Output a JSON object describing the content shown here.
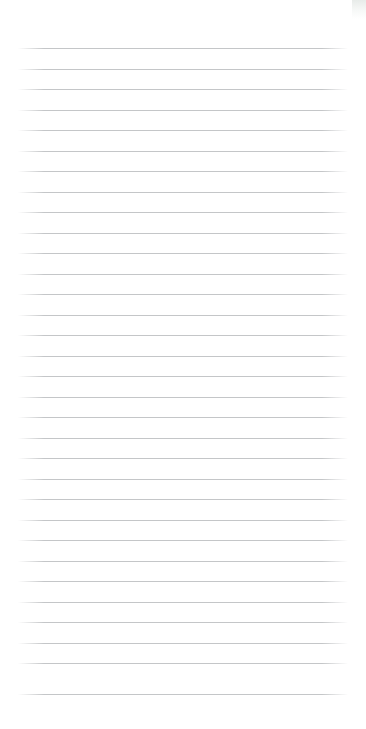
{
  "page": {
    "kind": "ruled-notepaper",
    "title": "",
    "width": 366,
    "height": 729,
    "background_color": "#ffffff",
    "text_content": "",
    "is_blank": true
  },
  "ruling": {
    "line_color": "#c0c2c4",
    "line_thickness_px": 1,
    "line_spacing_px": 20.4,
    "first_line_y_px": 48,
    "line_left_x_px": 18,
    "line_right_x_px": 348,
    "line_count": 32,
    "margin_top_px": 48,
    "margin_bottom_px": 34,
    "margin_left_px": 18,
    "margin_right_px": 18,
    "has_vertical_margin_rule": false,
    "lines": [
      {
        "index": 1,
        "y": 48,
        "written_text": ""
      },
      {
        "index": 2,
        "y": 69,
        "written_text": ""
      },
      {
        "index": 3,
        "y": 89,
        "written_text": ""
      },
      {
        "index": 4,
        "y": 110,
        "written_text": ""
      },
      {
        "index": 5,
        "y": 130,
        "written_text": ""
      },
      {
        "index": 6,
        "y": 151,
        "written_text": ""
      },
      {
        "index": 7,
        "y": 171,
        "written_text": ""
      },
      {
        "index": 8,
        "y": 192,
        "written_text": ""
      },
      {
        "index": 9,
        "y": 212,
        "written_text": ""
      },
      {
        "index": 10,
        "y": 233,
        "written_text": ""
      },
      {
        "index": 11,
        "y": 253,
        "written_text": ""
      },
      {
        "index": 12,
        "y": 274,
        "written_text": ""
      },
      {
        "index": 13,
        "y": 294,
        "written_text": ""
      },
      {
        "index": 14,
        "y": 315,
        "written_text": ""
      },
      {
        "index": 15,
        "y": 335,
        "written_text": ""
      },
      {
        "index": 16,
        "y": 356,
        "written_text": ""
      },
      {
        "index": 17,
        "y": 376,
        "written_text": ""
      },
      {
        "index": 18,
        "y": 397,
        "written_text": ""
      },
      {
        "index": 19,
        "y": 417,
        "written_text": ""
      },
      {
        "index": 20,
        "y": 438,
        "written_text": ""
      },
      {
        "index": 21,
        "y": 458,
        "written_text": ""
      },
      {
        "index": 22,
        "y": 479,
        "written_text": ""
      },
      {
        "index": 23,
        "y": 499,
        "written_text": ""
      },
      {
        "index": 24,
        "y": 520,
        "written_text": ""
      },
      {
        "index": 25,
        "y": 540,
        "written_text": ""
      },
      {
        "index": 26,
        "y": 561,
        "written_text": ""
      },
      {
        "index": 27,
        "y": 581,
        "written_text": ""
      },
      {
        "index": 28,
        "y": 602,
        "written_text": ""
      },
      {
        "index": 29,
        "y": 622,
        "written_text": ""
      },
      {
        "index": 30,
        "y": 643,
        "written_text": ""
      },
      {
        "index": 31,
        "y": 663,
        "written_text": ""
      },
      {
        "index": 32,
        "y": 694,
        "written_text": ""
      }
    ]
  },
  "artifacts": {
    "corner_mark": {
      "label": "scan-artifact",
      "color": "#e4e8e5",
      "x": 352,
      "y": 0,
      "width": 14,
      "height": 19
    }
  }
}
